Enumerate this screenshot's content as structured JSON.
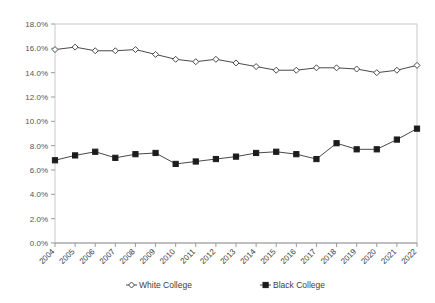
{
  "chart_data": {
    "type": "line",
    "title": "",
    "subtitle": "",
    "xlabel": "",
    "ylabel": "",
    "grid": false,
    "legend_position": "bottom",
    "categories": [
      "2004",
      "2005",
      "2006",
      "2007",
      "2008",
      "2009",
      "2010",
      "2011",
      "2012",
      "2013",
      "2014",
      "2015",
      "2016",
      "2017",
      "2018",
      "2019",
      "2020",
      "2021",
      "2022"
    ],
    "x": [
      2004,
      2005,
      2006,
      2007,
      2008,
      2009,
      2010,
      2011,
      2012,
      2013,
      2014,
      2015,
      2016,
      2017,
      2018,
      2019,
      2020,
      2021,
      2022
    ],
    "ylim": [
      0.0,
      18.0
    ],
    "ytick_step": 2.0,
    "ytick_labels": [
      "0.0%",
      "2.0%",
      "4.0%",
      "6.0%",
      "8.0%",
      "10.0%",
      "12.0%",
      "14.0%",
      "16.0%",
      "18.0%"
    ],
    "ytick_values": [
      0.0,
      2.0,
      4.0,
      6.0,
      8.0,
      10.0,
      12.0,
      14.0,
      16.0,
      18.0
    ],
    "series": [
      {
        "name": "White College",
        "marker": "open-diamond",
        "color": "#4a4a4a",
        "values": [
          15.9,
          16.1,
          15.8,
          15.8,
          15.9,
          15.5,
          15.1,
          14.9,
          15.1,
          14.8,
          14.5,
          14.2,
          14.2,
          14.4,
          14.4,
          14.3,
          14.0,
          14.2,
          14.6
        ]
      },
      {
        "name": "Black College",
        "marker": "filled-square",
        "color": "#1c1c1c",
        "values": [
          6.8,
          7.2,
          7.5,
          7.0,
          7.3,
          7.4,
          6.5,
          6.7,
          6.9,
          7.1,
          7.4,
          7.5,
          7.3,
          6.9,
          8.2,
          7.7,
          7.7,
          8.5,
          9.4
        ]
      }
    ],
    "legend": [
      {
        "label": "White College",
        "marker": "open-diamond"
      },
      {
        "label": "Black College",
        "marker": "filled-square"
      }
    ]
  },
  "colors": {
    "background": "#ffffff",
    "frame": "#c9c9c9",
    "axis": "#9a9a9a",
    "white_series": "#4a4a4a",
    "black_series": "#1c1c1c",
    "tick_text": "#555555"
  }
}
